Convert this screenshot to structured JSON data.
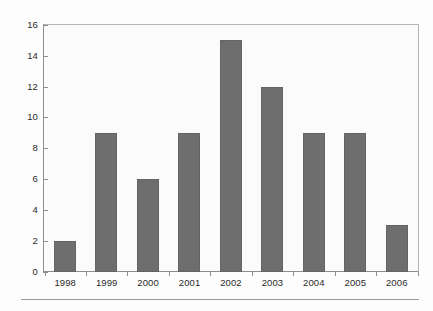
{
  "chart_data": {
    "type": "bar",
    "title": "",
    "xlabel": "",
    "ylabel": "",
    "categories": [
      "1998",
      "1999",
      "2000",
      "2001",
      "2002",
      "2003",
      "2004",
      "2005",
      "2006"
    ],
    "values": [
      2,
      9,
      6,
      9,
      15,
      12,
      9,
      9,
      3
    ],
    "ylim": [
      0,
      16
    ],
    "yticks": [
      0,
      2,
      4,
      6,
      8,
      10,
      12,
      14,
      16
    ],
    "ytick_labels": [
      "0",
      "2",
      "4",
      "6",
      "8",
      "10",
      "12",
      "14",
      "16"
    ],
    "grid": false,
    "legend": null,
    "bar_color": "#6e6e6e",
    "plot_background": "#fbfbfb",
    "axis_color": "#8e8e8e"
  }
}
